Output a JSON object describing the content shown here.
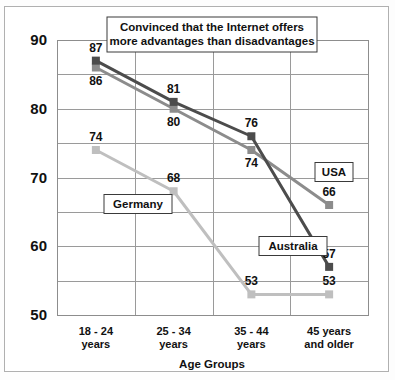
{
  "chart_data": {
    "type": "line",
    "title": "Convinced that the Internet offers more advantages than disadvantages",
    "title_line1": "Convinced that the Internet offers",
    "title_line2": "more advantages than disadvantages",
    "xlabel": "Age Groups",
    "ylabel": "",
    "categories": [
      "18 - 24 years",
      "25 - 34 years",
      "35 - 44 years",
      "45 years and older"
    ],
    "category_lines": [
      [
        "18 - 24",
        "years"
      ],
      [
        "25 - 34",
        "years"
      ],
      [
        "35 - 44",
        "years"
      ],
      [
        "45 years",
        "and older"
      ]
    ],
    "ylim": [
      50,
      90
    ],
    "ytick_labels": [
      "50",
      "60",
      "70",
      "80",
      "90"
    ],
    "ytick_values": [
      50,
      60,
      70,
      80,
      90
    ],
    "gridline_values": [
      50,
      55,
      60,
      65,
      70,
      75,
      80,
      85,
      90
    ],
    "grid": true,
    "legend_position": "inline-boxed-labels",
    "series": [
      {
        "name": "Australia",
        "color": "#4c4c4c",
        "values": [
          87,
          81,
          76,
          57
        ],
        "label_offsets": [
          "above",
          "above",
          "above",
          "above"
        ]
      },
      {
        "name": "USA",
        "color": "#8c8c8c",
        "values": [
          86,
          80,
          74,
          66
        ],
        "label_offsets": [
          "below",
          "below",
          "below",
          "above"
        ]
      },
      {
        "name": "Germany",
        "color": "#bfbfbf",
        "values": [
          74,
          68,
          53,
          53
        ],
        "label_offsets": [
          "above",
          "above",
          "above",
          "above"
        ]
      }
    ],
    "series_labels": [
      {
        "name": "USA",
        "text": "USA"
      },
      {
        "name": "Australia",
        "text": "Australia"
      },
      {
        "name": "Germany",
        "text": "Germany"
      }
    ]
  },
  "colors": {
    "australia": "#4c4c4c",
    "usa": "#8c8c8c",
    "germany": "#bfbfbf",
    "grid": "#9a9a9a",
    "text": "#111111",
    "frame": "#b0b0b0"
  }
}
